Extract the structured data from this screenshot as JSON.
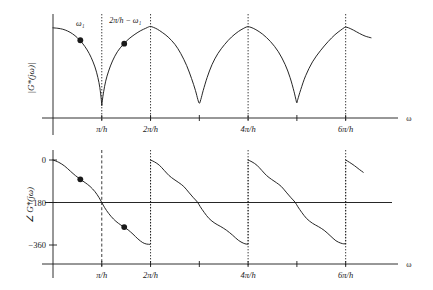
{
  "figure": {
    "name": "frequency-response-magnitude-phase-figure",
    "background": "#ffffff",
    "ink": "#1a1a1a",
    "curve_color": "#1a1a1a",
    "grid_color": "#1a1a1a"
  },
  "panels": {
    "magnitude": {
      "ylabel": "|G*(jω)|",
      "xlabel": "ω",
      "xticks": [
        "π/h",
        "2π/h",
        "4π/h",
        "6π/h"
      ],
      "annotations": [
        {
          "label": "ω1",
          "text": "ω₁"
        },
        {
          "label": "mirror",
          "text": "2π/h − ω₁"
        }
      ]
    },
    "phase": {
      "ylabel": "∠ G*(jω)",
      "xlabel": "ω",
      "yticks": [
        "0",
        "−180",
        "−360"
      ],
      "xticks": [
        "π/h",
        "2π/h",
        "4π/h",
        "6π/h"
      ]
    }
  },
  "chart_data": [
    {
      "type": "line",
      "id": "magnitude-plot",
      "title": "",
      "xlabel": "ω",
      "ylabel": "|G*(jω)|",
      "xlim": [
        0,
        7.4
      ],
      "ylim": [
        0,
        1.12
      ],
      "grid": false,
      "legend": false,
      "xtick_values": [
        1,
        2,
        4,
        6
      ],
      "xtick_labels": [
        "π/h",
        "2π/h",
        "4π/h",
        "6π/h"
      ],
      "xtick_unlabeled_values": [
        3,
        5
      ],
      "vertical_dotted_lines": [
        1,
        2,
        4,
        6
      ],
      "series": [
        {
          "name": "|G*(jω)|",
          "x": [
            0.0,
            0.1,
            0.2,
            0.3,
            0.4,
            0.5,
            0.6,
            0.7,
            0.78,
            0.86,
            0.92,
            0.96,
            0.99,
            1.0,
            1.01,
            1.04,
            1.08,
            1.14,
            1.22,
            1.32,
            1.44,
            1.56,
            1.68,
            1.8,
            1.9,
            1.96,
            2.0,
            2.06,
            2.14,
            2.24,
            2.36,
            2.5,
            2.62,
            2.74,
            2.84,
            2.92,
            2.97,
            3.0,
            3.03,
            3.08,
            3.16,
            3.26,
            3.38,
            3.52,
            3.66,
            3.8,
            3.9,
            3.96,
            4.0,
            4.06,
            4.16,
            4.3,
            4.46,
            4.62,
            4.76,
            4.86,
            4.94,
            4.98,
            5.0,
            5.02,
            5.08,
            5.18,
            5.32,
            5.48,
            5.64,
            5.78,
            5.9,
            5.97,
            6.0,
            6.06,
            6.16,
            6.28,
            6.4,
            6.52
          ],
          "y": [
            0.98,
            0.975,
            0.965,
            0.945,
            0.915,
            0.872,
            0.815,
            0.74,
            0.66,
            0.555,
            0.44,
            0.33,
            0.2,
            0.135,
            0.185,
            0.29,
            0.4,
            0.51,
            0.62,
            0.72,
            0.8,
            0.862,
            0.91,
            0.95,
            0.975,
            0.99,
            0.995,
            0.985,
            0.965,
            0.93,
            0.88,
            0.8,
            0.7,
            0.57,
            0.43,
            0.3,
            0.2,
            0.16,
            0.2,
            0.3,
            0.44,
            0.58,
            0.7,
            0.8,
            0.88,
            0.94,
            0.972,
            0.988,
            0.992,
            0.985,
            0.96,
            0.91,
            0.83,
            0.72,
            0.58,
            0.44,
            0.29,
            0.2,
            0.165,
            0.205,
            0.31,
            0.46,
            0.61,
            0.73,
            0.83,
            0.905,
            0.955,
            0.982,
            0.988,
            0.98,
            0.955,
            0.92,
            0.89,
            0.872
          ]
        }
      ],
      "points": [
        {
          "name": "omega1-point",
          "x": 0.56,
          "y": 0.845,
          "label": "ω₁",
          "label_x": 0.56,
          "label_y": 1.0
        },
        {
          "name": "mirror-point",
          "x": 1.46,
          "y": 0.808,
          "label": "2π/h − ω₁",
          "label_x": 1.48,
          "label_y": 1.03
        }
      ]
    },
    {
      "type": "line",
      "id": "phase-plot",
      "title": "",
      "xlabel": "ω",
      "ylabel": "∠ G*(jω)",
      "xlim": [
        0,
        7.4
      ],
      "ylim": [
        -430,
        20
      ],
      "grid": false,
      "legend": false,
      "ytick_values": [
        0,
        -180,
        -360
      ],
      "ytick_labels": [
        "0",
        "−180",
        "−360"
      ],
      "xtick_values": [
        1,
        2,
        4,
        6
      ],
      "xtick_labels": [
        "π/h",
        "2π/h",
        "4π/h",
        "6π/h"
      ],
      "xtick_unlabeled_values": [
        3,
        5
      ],
      "vertical_dashed_lines": [
        1
      ],
      "vertical_dotted_lines": [
        2,
        4,
        6
      ],
      "horizontal_reference_line": -180,
      "branches": [
        {
          "name": "branch-0-to-2",
          "x": [
            0.0,
            0.12,
            0.24,
            0.36,
            0.46,
            0.56,
            0.66,
            0.76,
            0.86,
            0.94,
            1.0,
            1.06,
            1.14,
            1.24,
            1.34,
            1.44,
            1.54,
            1.64,
            1.74,
            1.84,
            1.92,
            1.98
          ],
          "y": [
            0,
            -10,
            -26,
            -48,
            -66,
            -82,
            -96,
            -112,
            -134,
            -158,
            -180,
            -202,
            -226,
            -250,
            -268,
            -282,
            -296,
            -314,
            -334,
            -350,
            -356,
            -357
          ]
        },
        {
          "name": "branch-2-to-4",
          "x": [
            2.0,
            2.08,
            2.18,
            2.28,
            2.38,
            2.48,
            2.58,
            2.68,
            2.78,
            2.88,
            2.96,
            3.02,
            3.1,
            3.2,
            3.32,
            3.44,
            3.56,
            3.68,
            3.8,
            3.9,
            3.96,
            3.99
          ],
          "y": [
            0,
            -8,
            -22,
            -44,
            -66,
            -82,
            -96,
            -112,
            -136,
            -160,
            -178,
            -198,
            -222,
            -248,
            -268,
            -282,
            -298,
            -318,
            -340,
            -352,
            -356,
            -356
          ]
        },
        {
          "name": "branch-4-to-6",
          "x": [
            4.0,
            4.08,
            4.18,
            4.28,
            4.38,
            4.48,
            4.58,
            4.68,
            4.78,
            4.88,
            4.96,
            5.02,
            5.1,
            5.2,
            5.32,
            5.44,
            5.56,
            5.68,
            5.8,
            5.9,
            5.96,
            5.99
          ],
          "y": [
            0,
            -8,
            -22,
            -44,
            -66,
            -82,
            -96,
            -112,
            -136,
            -160,
            -178,
            -198,
            -222,
            -248,
            -268,
            -282,
            -298,
            -320,
            -342,
            -352,
            -355,
            -355
          ]
        },
        {
          "name": "branch-6-end",
          "x": [
            6.0,
            6.08,
            6.18,
            6.28,
            6.36
          ],
          "y": [
            0,
            -10,
            -24,
            -40,
            -52
          ]
        }
      ],
      "points": [
        {
          "name": "omega1-phase-point",
          "x": 0.56,
          "y": -82
        },
        {
          "name": "mirror-phase-point",
          "x": 1.46,
          "y": -284
        }
      ]
    }
  ]
}
